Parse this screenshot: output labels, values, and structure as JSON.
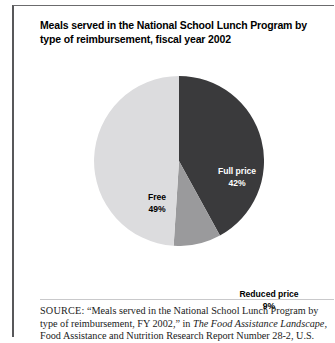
{
  "figure": {
    "title": "Meals served in the National School Lunch Program by type of reimbursement, fiscal year 2002",
    "source_label": "SOURCE:",
    "source_text_part1": " “Meals served in the National School Lunch Program by type of reimbursement, FY 2002,” in ",
    "source_italic": "The Food Assistance Landscape,",
    "source_text_part2": " Food Assistance and Nutrition Research Report Number 28-2, U.S."
  },
  "labels": {
    "full_price_name": "Full price",
    "full_price_pct": "42%",
    "free_name": "Free",
    "free_pct": "49%",
    "reduced_name": "Reduced price",
    "reduced_pct": "9%"
  },
  "colors": {
    "full_price": "#3a3a3c",
    "reduced_price": "#9a9a9c",
    "free": "#dcdcde",
    "frame": "#58585a",
    "divider": "#c9c9cb"
  },
  "chart_data": {
    "type": "pie",
    "title": "Meals served in the National School Lunch Program by type of reimbursement, fiscal year 2002",
    "xlabel": "",
    "ylabel": "",
    "legend_position": "none",
    "labels_inside": true,
    "start_angle_deg": 0,
    "direction": "clockwise",
    "categories": [
      "Full price",
      "Reduced price",
      "Free"
    ],
    "values": [
      42,
      9,
      49
    ],
    "value_unit": "percent",
    "slice_colors": [
      "#3a3a3c",
      "#9a9a9c",
      "#dcdcde"
    ],
    "slices": [
      {
        "label": "Full price",
        "value": 42,
        "display": "42%",
        "color": "#3a3a3c",
        "text_color": "#ffffff"
      },
      {
        "label": "Reduced price",
        "value": 9,
        "display": "9%",
        "color": "#9a9a9c",
        "text_color": "#000000"
      },
      {
        "label": "Free",
        "value": 49,
        "display": "49%",
        "color": "#dcdcde",
        "text_color": "#000000"
      }
    ],
    "total": 100
  }
}
